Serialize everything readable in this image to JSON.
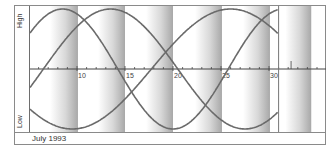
{
  "chart_data": {
    "type": "line",
    "title": "July 1993",
    "xlabel": "",
    "ylabel_top": "High",
    "ylabel_bottom": "Low",
    "x_ticks": [
      10,
      15,
      20,
      25,
      30
    ],
    "x_range": [
      5,
      36
    ],
    "y_range": [
      -1,
      1
    ],
    "end_marker_day": 31,
    "shaded_bands_days": [
      [
        7.2,
        10.1
      ],
      [
        12.2,
        15
      ],
      [
        17.2,
        20
      ],
      [
        22.3,
        25.1
      ],
      [
        27.3,
        30.1
      ],
      [
        31.7,
        34.4
      ]
    ],
    "series": [
      {
        "name": "Curve A",
        "period_days": 23,
        "peak_day": 8.5,
        "note": "peaks near day 8-9, trough near day 20, rising to day 31"
      },
      {
        "name": "Curve B",
        "period_days": 28,
        "peak_day": 13.5,
        "note": "rises from low at day 5, peaks near day 13, trough near day 27"
      },
      {
        "name": "Curve C",
        "period_days": 33,
        "peak_day": 26,
        "note": "trough near day 9, crosses zero near day 17, peaks near day 25"
      }
    ],
    "grid": false
  },
  "labels": {
    "high": "High",
    "low": "Low",
    "month": "July 1993",
    "ticks": [
      "10",
      "15",
      "20",
      "25",
      "30"
    ]
  }
}
